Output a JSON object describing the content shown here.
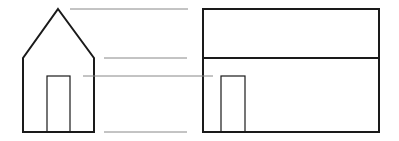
{
  "diagram": {
    "colors": {
      "outline": "#1a1a1a",
      "projection_line": "#888888",
      "background": "#ffffff"
    },
    "front_view": {
      "roof_apex": [
        58,
        9
      ],
      "walls": {
        "left": 23,
        "right": 94,
        "top": 58,
        "bottom": 132
      },
      "door": {
        "x": 47,
        "y": 76,
        "w": 23,
        "h": 56
      }
    },
    "side_view": {
      "rect": {
        "x": 203,
        "y": 9,
        "w": 176,
        "h": 123
      },
      "eave_line_y": 58,
      "door": {
        "x": 221,
        "y": 76,
        "w": 24,
        "h": 56
      }
    },
    "projection_lines": [
      {
        "x1": 70,
        "y1": 9,
        "x2": 188,
        "y2": 9
      },
      {
        "x1": 104,
        "y1": 58,
        "x2": 187,
        "y2": 58
      },
      {
        "x1": 83,
        "y1": 76,
        "x2": 213,
        "y2": 76
      },
      {
        "x1": 104,
        "y1": 132,
        "x2": 187,
        "y2": 132
      }
    ]
  }
}
